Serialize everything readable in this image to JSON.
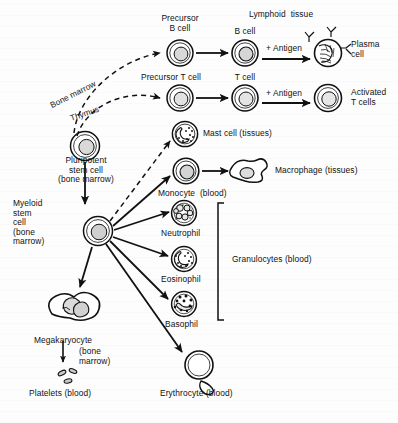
{
  "figure": {
    "background_color": "#fdfdfd",
    "ink_color": "#111111"
  },
  "nodes": {
    "pluripotent": {
      "label": "Pluripotent\nstem cell\n(bone marrow)",
      "name": "pluripotent-stem-cell"
    },
    "myeloid": {
      "label": "Myeloid\nstem\ncell\n(bone\nmarrow)",
      "name": "myeloid-stem-cell"
    },
    "precursor_b": {
      "label": "Precursor\nB cell",
      "name": "precursor-b-cell"
    },
    "precursor_t": {
      "label": "Precursor T cell",
      "name": "precursor-t-cell"
    },
    "b_cell": {
      "label": "B cell",
      "name": "b-cell"
    },
    "t_cell": {
      "label": "T cell",
      "name": "t-cell"
    },
    "plasma_cell": {
      "label": "Plasma\ncell",
      "name": "plasma-cell"
    },
    "activated_t": {
      "label": "Activated\nT cells",
      "name": "activated-t-cells"
    },
    "mast_cell": {
      "label": "Mast cell (tissues)",
      "name": "mast-cell"
    },
    "monocyte": {
      "label": "Monocyte  (blood)",
      "name": "monocyte"
    },
    "macrophage": {
      "label": "Macrophage (tissues)",
      "name": "macrophage"
    },
    "neutrophil": {
      "label": "Neutrophil",
      "name": "neutrophil"
    },
    "eosinophil": {
      "label": "Eosinophil",
      "name": "eosinophil"
    },
    "basophil": {
      "label": "Basophil",
      "name": "basophil"
    },
    "megakaryocyte": {
      "label": "Megakaryocyte",
      "name": "megakaryocyte"
    },
    "megakaryocyte_sub": {
      "label": "(bone\nmarrow)",
      "name": "megakaryocyte-sublabel"
    },
    "platelets": {
      "label": "Platelets (blood)",
      "name": "platelets"
    },
    "erythrocyte": {
      "label": "Erythrocyte (blood)",
      "name": "erythrocyte"
    }
  },
  "annotations": {
    "lymphoid_tissue": {
      "label": "Lymphoid  tissue",
      "name": "lymphoid-tissue-heading"
    },
    "bone_marrow_path": {
      "label": "Bone marrow",
      "name": "bone-marrow-pathway-label"
    },
    "thymus_path": {
      "label": "Thymus",
      "name": "thymus-pathway-label"
    },
    "antigen_b": {
      "label": "+ Antigen",
      "name": "antigen-b-label"
    },
    "antigen_t": {
      "label": "+ Antigen",
      "name": "antigen-t-label"
    },
    "granulocytes": {
      "label": "Granulocytes (blood)",
      "name": "granulocytes-bracket-label"
    }
  }
}
